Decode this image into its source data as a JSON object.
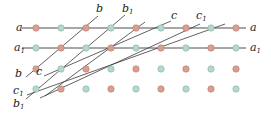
{
  "diagram": {
    "type": "lattice-with-lines",
    "colors": {
      "red": "#d9a091",
      "teal": "#b6d6d0",
      "red_stroke": "#b5786a",
      "teal_stroke": "#86b3ab",
      "line": "#3a3a3a"
    },
    "rows": [
      {
        "y": 28,
        "x0": 22,
        "x1": 246,
        "first": "red",
        "label": {
          "left": "a",
          "right": "a"
        }
      },
      {
        "y": 48,
        "x0": 22,
        "x1": 246,
        "first": "teal",
        "label": {
          "left": "a1",
          "right": "a1"
        }
      },
      {
        "y": 69,
        "first": "red"
      },
      {
        "y": 89,
        "first": "teal"
      }
    ],
    "xs": [
      36,
      61,
      86,
      111,
      136,
      161,
      186,
      211,
      236
    ],
    "lines": [
      {
        "name": "b",
        "x1": 98,
        "y1": 16,
        "x2": 26,
        "y2": 77
      },
      {
        "name": "b1",
        "x1": 125,
        "y1": 15,
        "x2": 26,
        "y2": 99
      },
      {
        "name": "c",
        "x1": 171,
        "y1": 21,
        "x2": 44,
        "y2": 76
      },
      {
        "name": "c1",
        "x1": 225,
        "y1": 24,
        "x2": 27,
        "y2": 95
      },
      {
        "name": "extra1",
        "x1": 200,
        "y1": 24,
        "x2": 40,
        "y2": 98
      },
      {
        "name": "extra2",
        "x1": 145,
        "y1": 22,
        "x2": 45,
        "y2": 96
      }
    ],
    "labels": [
      {
        "text": "a",
        "sub": "",
        "x": 16,
        "y": 31
      },
      {
        "text": "a",
        "sub": "1",
        "x": 14,
        "y": 51
      },
      {
        "text": "a",
        "sub": "",
        "x": 250,
        "y": 31
      },
      {
        "text": "a",
        "sub": "1",
        "x": 250,
        "y": 51
      },
      {
        "text": "b",
        "sub": "",
        "x": 96,
        "y": 12
      },
      {
        "text": "b",
        "sub": "1",
        "x": 122,
        "y": 12
      },
      {
        "text": "c",
        "sub": "",
        "x": 171,
        "y": 19
      },
      {
        "text": "c",
        "sub": "1",
        "x": 196,
        "y": 19
      },
      {
        "text": "b",
        "sub": "",
        "x": 15,
        "y": 77
      },
      {
        "text": "c",
        "sub": "",
        "x": 36,
        "y": 75
      },
      {
        "text": "c",
        "sub": "1",
        "x": 13,
        "y": 94
      },
      {
        "text": "b",
        "sub": "1",
        "x": 13,
        "y": 107
      }
    ]
  }
}
